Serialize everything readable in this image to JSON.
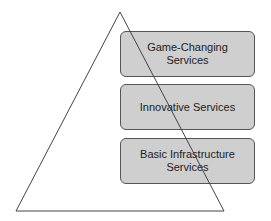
{
  "diagram": {
    "type": "pyramid",
    "levels": [
      {
        "label": "Game-Changing\nServices"
      },
      {
        "label": "Innovative Services"
      },
      {
        "label": "Basic Infrastructure\nServices"
      }
    ]
  },
  "colors": {
    "box_fill": "#cfcfcf",
    "box_border": "#555555",
    "line": "#444444"
  }
}
